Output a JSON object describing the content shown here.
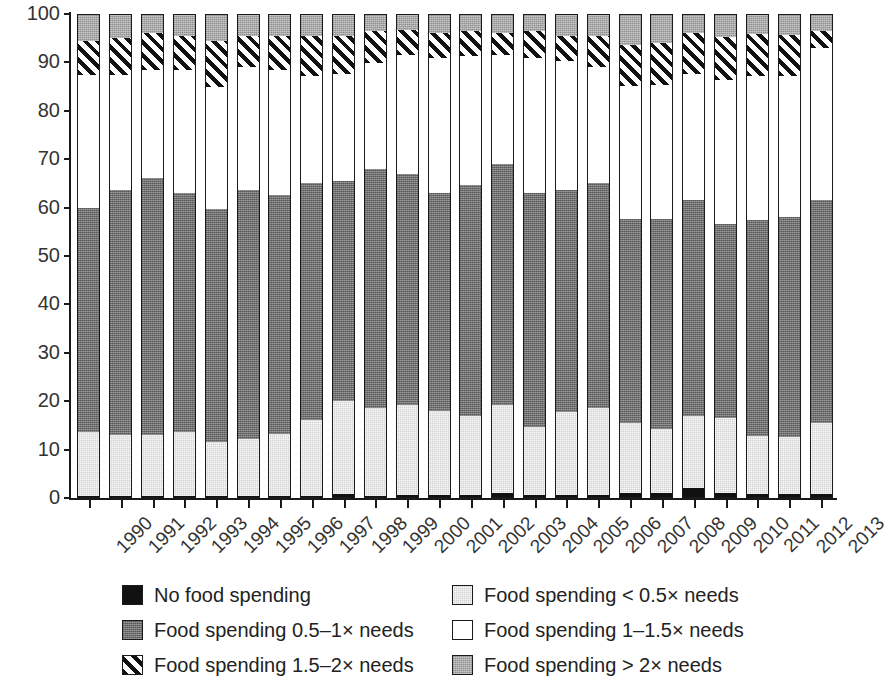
{
  "chart_data": {
    "type": "bar",
    "subtype": "stacked-percent",
    "title": "",
    "xlabel": "",
    "ylabel": "Percent",
    "ylim": [
      0,
      100
    ],
    "yticks": [
      0,
      10,
      20,
      30,
      40,
      50,
      60,
      70,
      80,
      90,
      100
    ],
    "grid": false,
    "legend_position": "bottom",
    "categories": [
      "1990",
      "1991",
      "1992",
      "1993",
      "1994",
      "1995",
      "1996",
      "1997",
      "1998",
      "1999",
      "2000",
      "2001",
      "2002",
      "2003",
      "2004",
      "2005",
      "2006",
      "2007",
      "2008",
      "2009",
      "2010",
      "2011",
      "2012",
      "2013"
    ],
    "series": [
      {
        "name": "No food spending",
        "key": "none",
        "fill": "solid-black",
        "color": "#111111",
        "values": [
          0.4,
          0.4,
          0.4,
          0.4,
          0.4,
          0.4,
          0.4,
          0.5,
          0.9,
          0.5,
          0.6,
          0.6,
          0.6,
          1.1,
          0.7,
          0.6,
          0.7,
          1.0,
          1.1,
          2.0,
          1.0,
          0.8,
          0.8,
          0.8
        ]
      },
      {
        "name": "Food spending < 0.5× needs",
        "key": "lt_half",
        "fill": "light-gray",
        "color": "#d2d2d2",
        "values": [
          13.2,
          12.7,
          12.6,
          13.2,
          11.2,
          11.8,
          12.8,
          15.6,
          19.1,
          18.0,
          18.7,
          17.3,
          16.3,
          18.1,
          14.0,
          17.2,
          17.8,
          14.4,
          13.2,
          15.0,
          15.6,
          12.0,
          11.8,
          14.7
        ]
      },
      {
        "name": "Food spending 0.5–1× needs",
        "key": "half_to_1",
        "fill": "dark-gray",
        "color": "#6f6f6f",
        "values": [
          46.4,
          50.5,
          53.2,
          49.4,
          48.2,
          51.4,
          49.4,
          48.9,
          45.5,
          49.5,
          47.7,
          45.1,
          47.7,
          49.8,
          48.3,
          45.8,
          46.5,
          42.2,
          43.3,
          44.6,
          40.0,
          44.7,
          45.4,
          46.0
        ]
      },
      {
        "name": "Food spending 1–1.5× needs",
        "key": "1_to_15",
        "fill": "white",
        "color": "#ffffff",
        "values": [
          27.4,
          23.9,
          22.3,
          25.4,
          25.1,
          25.5,
          25.9,
          22.2,
          22.1,
          21.9,
          24.5,
          27.9,
          26.7,
          22.5,
          27.9,
          26.6,
          24.1,
          27.5,
          27.7,
          26.0,
          29.7,
          29.7,
          29.2,
          31.5
        ]
      },
      {
        "name": "Food spending 1.5–2× needs",
        "key": "15_to_2",
        "fill": "diagonal-hatch",
        "color": "#111111",
        "values": [
          7.1,
          7.5,
          7.5,
          7.1,
          9.6,
          6.4,
          7.0,
          8.3,
          7.8,
          6.6,
          5.1,
          5.2,
          5.1,
          4.6,
          5.6,
          5.2,
          6.4,
          8.4,
          8.7,
          8.5,
          9.0,
          8.7,
          8.5,
          3.4
        ]
      },
      {
        "name": "Food spending > 2× needs",
        "key": "gt_2",
        "fill": "medium-gray",
        "color": "#a8a8a8",
        "values": [
          5.5,
          5.0,
          4.0,
          4.5,
          5.5,
          4.5,
          4.5,
          4.5,
          4.6,
          3.5,
          3.4,
          3.9,
          3.6,
          3.9,
          3.5,
          4.6,
          4.5,
          6.5,
          6.0,
          3.9,
          4.7,
          4.1,
          4.3,
          3.6
        ]
      }
    ]
  },
  "legend": {
    "items": [
      {
        "label": "No food spending",
        "swatch": "none"
      },
      {
        "label": "Food spending < 0.5× needs",
        "swatch": "lt_half"
      },
      {
        "label": "Food spending 0.5–1× needs",
        "swatch": "half_to_1"
      },
      {
        "label": "Food spending 1–1.5× needs",
        "swatch": "1_to_15"
      },
      {
        "label": "Food spending 1.5–2× needs",
        "swatch": "15_to_2"
      },
      {
        "label": "Food spending > 2× needs",
        "swatch": "gt_2"
      }
    ]
  }
}
